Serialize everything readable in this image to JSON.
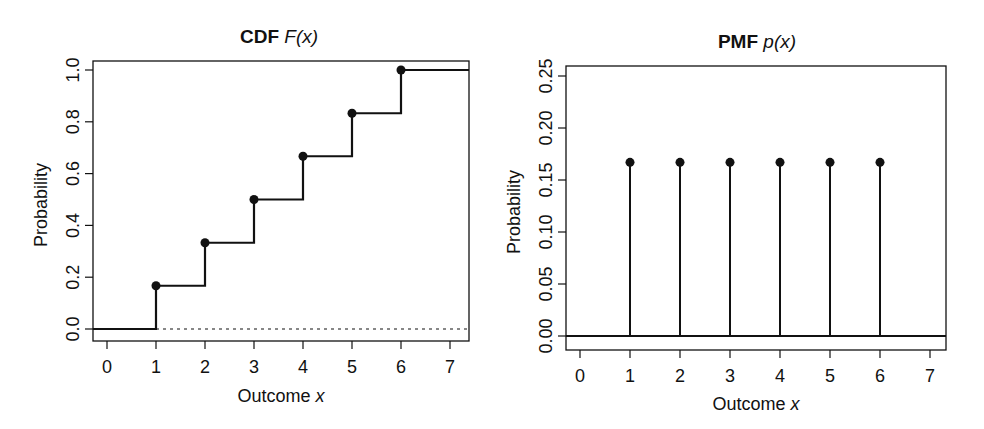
{
  "chart_data": [
    {
      "type": "line",
      "subtype": "step-cdf",
      "title": {
        "bold": "CDF",
        "italic": "F(x)"
      },
      "xlabel": {
        "text": "Outcome",
        "italic": "x"
      },
      "ylabel": "Probability",
      "xlim": [
        -0.3,
        7.3
      ],
      "ylim": [
        -0.03,
        1.03
      ],
      "xticks": [
        0,
        1,
        2,
        3,
        4,
        5,
        6,
        7
      ],
      "xtick_labels": [
        "0",
        "1",
        "2",
        "3",
        "4",
        "5",
        "6",
        "7"
      ],
      "yticks": [
        0.0,
        0.2,
        0.4,
        0.6,
        0.8,
        1.0
      ],
      "ytick_labels": [
        "0.0",
        "0.2",
        "0.4",
        "0.6",
        "0.8",
        "1.0"
      ],
      "grid": false,
      "legend": null,
      "x": [
        1,
        2,
        3,
        4,
        5,
        6
      ],
      "values": [
        0.167,
        0.333,
        0.5,
        0.667,
        0.833,
        1.0
      ],
      "start_value": 0.0,
      "reference_line": {
        "y": 0.0,
        "style": "dotted",
        "from_x": 1
      },
      "markers": "filled-circle-at-jump"
    },
    {
      "type": "bar",
      "subtype": "stem-pmf",
      "title": {
        "bold": "PMF",
        "italic": "p(x)"
      },
      "xlabel": {
        "text": "Outcome",
        "italic": "x"
      },
      "ylabel": "Probability",
      "xlim": [
        -0.3,
        7.3
      ],
      "ylim": [
        -0.008,
        0.26
      ],
      "xticks": [
        0,
        1,
        2,
        3,
        4,
        5,
        6,
        7
      ],
      "xtick_labels": [
        "0",
        "1",
        "2",
        "3",
        "4",
        "5",
        "6",
        "7"
      ],
      "yticks": [
        0.0,
        0.05,
        0.1,
        0.15,
        0.2,
        0.25
      ],
      "ytick_labels": [
        "0.00",
        "0.05",
        "0.10",
        "0.15",
        "0.20",
        "0.25"
      ],
      "grid": false,
      "legend": null,
      "categories": [
        1,
        2,
        3,
        4,
        5,
        6
      ],
      "values": [
        0.167,
        0.167,
        0.167,
        0.167,
        0.167,
        0.167
      ],
      "baseline": {
        "y": 0.0,
        "style": "solid"
      },
      "markers": "filled-circle-at-top"
    }
  ],
  "layout": [
    {
      "box": {
        "left": 93,
        "top": 61,
        "right": 469,
        "bottom": 341
      },
      "x0px": 107,
      "x1px": 156,
      "ymap": {
        "v0": 0.0,
        "p0": 329,
        "v1": 1.0,
        "p1": 70
      },
      "title_center": 279,
      "title_y": 43,
      "ylabel_x": 47,
      "xlabel_y": 402
    },
    {
      "box": {
        "left": 566,
        "top": 66,
        "right": 946,
        "bottom": 350
      },
      "x0px": 580,
      "x1px": 630,
      "ymap": {
        "v0": 0.0,
        "p0": 336,
        "v1": 0.25,
        "p1": 76
      },
      "title_center": 757,
      "title_y": 48,
      "ylabel_x": 520,
      "xlabel_y": 410
    }
  ],
  "colors": {
    "ink": "#111111",
    "background": "#ffffff"
  }
}
